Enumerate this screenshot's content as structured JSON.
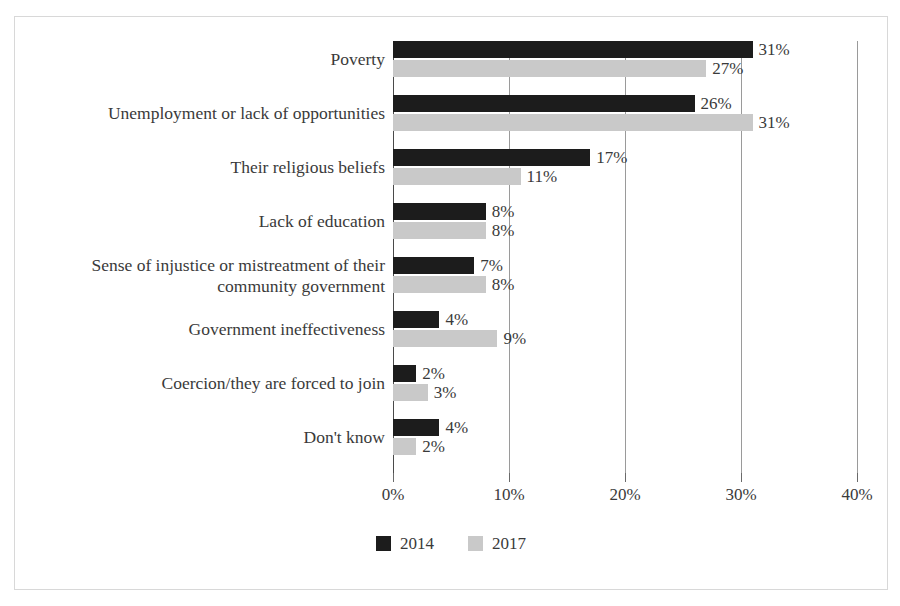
{
  "chart_data": {
    "type": "bar",
    "orientation": "horizontal",
    "title": "",
    "xlabel": "",
    "ylabel": "",
    "xlim": [
      0,
      40
    ],
    "grid": true,
    "legend_position": "bottom",
    "categories": [
      "Poverty",
      "Unemployment or lack of opportunities",
      "Their religious beliefs",
      "Lack of education",
      "Sense of injustice or mistreatment of their\ncommunity government",
      "Government ineffectiveness",
      "Coercion/they are forced to join",
      "Don't know"
    ],
    "series": [
      {
        "name": "2014",
        "color": "#1c1c1c",
        "values": [
          31,
          26,
          17,
          8,
          7,
          4,
          2,
          4
        ],
        "labels": [
          "31%",
          "26%",
          "17%",
          "8%",
          "7%",
          "4%",
          "2%",
          "4%"
        ]
      },
      {
        "name": "2017",
        "color": "#c9c9c9",
        "values": [
          27,
          31,
          11,
          8,
          8,
          9,
          3,
          2
        ],
        "labels": [
          "27%",
          "31%",
          "11%",
          "8%",
          "8%",
          "9%",
          "3%",
          "2%"
        ]
      }
    ],
    "xticks": [
      0,
      10,
      20,
      30,
      40
    ],
    "xtick_labels": [
      "0%",
      "10%",
      "20%",
      "30%",
      "40%"
    ]
  },
  "legend": {
    "items": [
      {
        "label": "2014",
        "color": "#1c1c1c"
      },
      {
        "label": "2017",
        "color": "#c9c9c9"
      }
    ]
  },
  "colors": {
    "series_2014": "#1c1c1c",
    "series_2017": "#c9c9c9",
    "axis": "#4a4a4a",
    "gridline": "#9a9a9a",
    "text": "#3a3a3a",
    "frame_border": "#d8d8d8",
    "background": "#ffffff"
  }
}
